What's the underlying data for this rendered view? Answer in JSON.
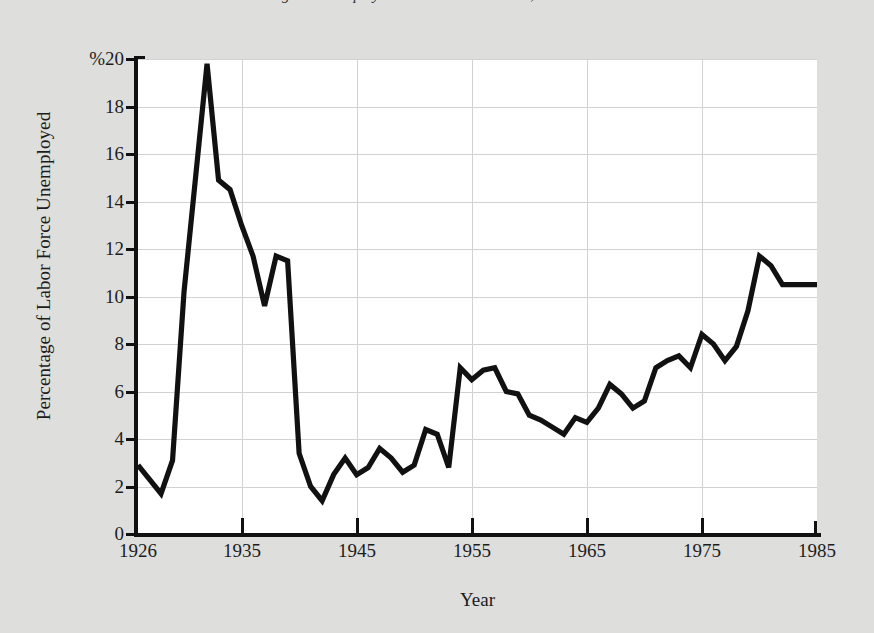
{
  "figure": {
    "top_title_clipped": "Figure: Unemployment in the United States, 1926–1985",
    "background_color": "#dededc",
    "plot_background_color": "#ffffff",
    "line_color": "#111111",
    "grid_color": "#d2d2d2"
  },
  "axes": {
    "y_title": "Percentage of Labor Force Unemployed",
    "x_title": "Year",
    "y_tick_labels": [
      "%20",
      "18",
      "16",
      "14",
      "12",
      "10",
      "8",
      "6",
      "4",
      "2",
      "0"
    ],
    "y_tick_values": [
      20,
      18,
      16,
      14,
      12,
      10,
      8,
      6,
      4,
      2,
      0
    ],
    "x_tick_labels": [
      "1926",
      "1935",
      "1945",
      "1955",
      "1965",
      "1975",
      "1985"
    ],
    "x_tick_values": [
      1926,
      1935,
      1945,
      1955,
      1965,
      1975,
      1985
    ]
  },
  "chart_data": {
    "type": "line",
    "title": "Unemployment in the United States, 1926–1985",
    "xlabel": "Year",
    "ylabel": "Percentage of Labor Force Unemployed",
    "xlim": [
      1926,
      1985
    ],
    "ylim": [
      0,
      20
    ],
    "grid": true,
    "legend": "none",
    "x": [
      1926,
      1927,
      1928,
      1929,
      1930,
      1931,
      1932,
      1933,
      1934,
      1935,
      1936,
      1937,
      1938,
      1939,
      1940,
      1941,
      1942,
      1943,
      1944,
      1945,
      1946,
      1947,
      1948,
      1949,
      1950,
      1951,
      1952,
      1953,
      1954,
      1955,
      1956,
      1957,
      1958,
      1959,
      1960,
      1961,
      1962,
      1963,
      1964,
      1965,
      1966,
      1967,
      1968,
      1969,
      1970,
      1971,
      1972,
      1973,
      1974,
      1975,
      1976,
      1977,
      1978,
      1979,
      1980,
      1981,
      1982,
      1983,
      1984,
      1985
    ],
    "series": [
      {
        "name": "Percentage of Labor Force Unemployed",
        "values": [
          2.9,
          2.3,
          1.7,
          3.1,
          10.2,
          15.0,
          19.8,
          14.9,
          14.5,
          13.0,
          11.7,
          9.6,
          11.7,
          11.5,
          3.4,
          2.0,
          1.4,
          2.5,
          3.2,
          2.5,
          2.8,
          3.6,
          3.2,
          2.6,
          2.9,
          4.4,
          4.2,
          2.8,
          7.0,
          6.5,
          6.9,
          7.0,
          6.0,
          5.9,
          5.0,
          4.8,
          4.5,
          4.2,
          4.9,
          4.7,
          5.3,
          6.3,
          5.9,
          5.3,
          5.6,
          7.0,
          7.3,
          7.5,
          7.0,
          8.4,
          8.0,
          7.3,
          7.9,
          9.4,
          11.7,
          11.3,
          10.5,
          10.5,
          10.5,
          10.5
        ]
      }
    ]
  }
}
